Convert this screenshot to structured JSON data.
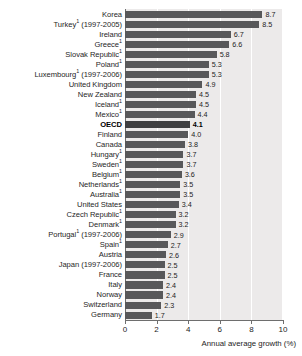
{
  "chart_data": {
    "type": "bar",
    "orientation": "horizontal",
    "title": "",
    "xlabel": "Annual average growth (%)",
    "ylabel": "",
    "xlim": [
      0,
      10
    ],
    "xticks": [
      0,
      2,
      4,
      6,
      8,
      10
    ],
    "grid": true,
    "legend": null,
    "highlight_category": "OECD",
    "value_format": "one-decimal",
    "footnote_marker": "1",
    "categories": [
      "Korea",
      "Turkey¹ (1997-2005)",
      "Ireland",
      "Greece¹",
      "Slovak Republic¹",
      "Poland¹",
      "Luxembourg¹ (1997-2006)",
      "United Kingdom",
      "New Zealand",
      "Iceland¹",
      "Mexico¹",
      "OECD",
      "Finland",
      "Canada",
      "Hungary¹",
      "Sweden¹",
      "Belgium¹",
      "Netherlands¹",
      "Australia¹",
      "United States",
      "Czech Republic¹",
      "Denmark¹",
      "Portugal¹ (1997-2006)",
      "Spain¹",
      "Austria",
      "Japan (1997-2006)",
      "France",
      "Italy",
      "Norway",
      "Switzerland",
      "Germany"
    ],
    "values": [
      8.7,
      8.5,
      6.7,
      6.6,
      5.8,
      5.3,
      5.3,
      4.9,
      4.5,
      4.5,
      4.4,
      4.1,
      4.0,
      3.8,
      3.7,
      3.7,
      3.6,
      3.5,
      3.5,
      3.4,
      3.2,
      3.2,
      2.9,
      2.7,
      2.6,
      2.5,
      2.5,
      2.4,
      2.4,
      2.3,
      1.7
    ]
  },
  "rows": [
    {
      "label": "Korea",
      "sup": "",
      "value": 8.7,
      "value_text": "8.7",
      "highlight": false
    },
    {
      "label": "Turkey",
      "sup": "1",
      "suffix": " (1997-2005)",
      "value": 8.5,
      "value_text": "8.5",
      "highlight": false
    },
    {
      "label": "Ireland",
      "sup": "",
      "value": 6.7,
      "value_text": "6.7",
      "highlight": false
    },
    {
      "label": "Greece",
      "sup": "1",
      "value": 6.6,
      "value_text": "6.6",
      "highlight": false
    },
    {
      "label": "Slovak Republic",
      "sup": "1",
      "value": 5.8,
      "value_text": "5.8",
      "highlight": false
    },
    {
      "label": "Poland",
      "sup": "1",
      "value": 5.3,
      "value_text": "5.3",
      "highlight": false
    },
    {
      "label": "Luxembourg",
      "sup": "1",
      "suffix": " (1997-2006)",
      "value": 5.3,
      "value_text": "5.3",
      "highlight": false
    },
    {
      "label": "United Kingdom",
      "sup": "",
      "value": 4.9,
      "value_text": "4.9",
      "highlight": false
    },
    {
      "label": "New Zealand",
      "sup": "",
      "value": 4.5,
      "value_text": "4.5",
      "highlight": false
    },
    {
      "label": "Iceland",
      "sup": "1",
      "value": 4.5,
      "value_text": "4.5",
      "highlight": false
    },
    {
      "label": "Mexico",
      "sup": "1",
      "value": 4.4,
      "value_text": "4.4",
      "highlight": false
    },
    {
      "label": "OECD",
      "sup": "",
      "value": 4.1,
      "value_text": "4.1",
      "highlight": true
    },
    {
      "label": "Finland",
      "sup": "",
      "value": 4.0,
      "value_text": "4.0",
      "highlight": false
    },
    {
      "label": "Canada",
      "sup": "",
      "value": 3.8,
      "value_text": "3.8",
      "highlight": false
    },
    {
      "label": "Hungary",
      "sup": "1",
      "value": 3.7,
      "value_text": "3.7",
      "highlight": false
    },
    {
      "label": "Sweden",
      "sup": "1",
      "value": 3.7,
      "value_text": "3.7",
      "highlight": false
    },
    {
      "label": "Belgium",
      "sup": "1",
      "value": 3.6,
      "value_text": "3.6",
      "highlight": false
    },
    {
      "label": "Netherlands",
      "sup": "1",
      "value": 3.5,
      "value_text": "3.5",
      "highlight": false
    },
    {
      "label": "Australia",
      "sup": "1",
      "value": 3.5,
      "value_text": "3.5",
      "highlight": false
    },
    {
      "label": "United States",
      "sup": "",
      "value": 3.4,
      "value_text": "3.4",
      "highlight": false
    },
    {
      "label": "Czech Republic",
      "sup": "1",
      "value": 3.2,
      "value_text": "3.2",
      "highlight": false
    },
    {
      "label": "Denmark",
      "sup": "1",
      "value": 3.2,
      "value_text": "3.2",
      "highlight": false
    },
    {
      "label": "Portugal",
      "sup": "1",
      "suffix": " (1997-2006)",
      "value": 2.9,
      "value_text": "2.9",
      "highlight": false
    },
    {
      "label": "Spain",
      "sup": "1",
      "value": 2.7,
      "value_text": "2.7",
      "highlight": false
    },
    {
      "label": "Austria",
      "sup": "",
      "value": 2.6,
      "value_text": "2.6",
      "highlight": false
    },
    {
      "label": "Japan",
      "sup": "",
      "suffix": " (1997-2006)",
      "value": 2.5,
      "value_text": "2.5",
      "highlight": false
    },
    {
      "label": "France",
      "sup": "",
      "value": 2.5,
      "value_text": "2.5",
      "highlight": false
    },
    {
      "label": "Italy",
      "sup": "",
      "value": 2.4,
      "value_text": "2.4",
      "highlight": false
    },
    {
      "label": "Norway",
      "sup": "",
      "value": 2.4,
      "value_text": "2.4",
      "highlight": false
    },
    {
      "label": "Switzerland",
      "sup": "",
      "value": 2.3,
      "value_text": "2.3",
      "highlight": false
    },
    {
      "label": "Germany",
      "sup": "",
      "value": 1.7,
      "value_text": "1.7",
      "highlight": false
    }
  ],
  "axis": {
    "ticks": [
      "0",
      "2",
      "4",
      "6",
      "8",
      "10"
    ],
    "title": "Annual average growth (%)"
  },
  "colors": {
    "bar": "#58585a",
    "bar_highlight": "#3f3f41",
    "plot_background": "#eceaea",
    "gridline": "#ffffff",
    "axis": "#6e6e6e",
    "text": "#1c1c1c"
  }
}
